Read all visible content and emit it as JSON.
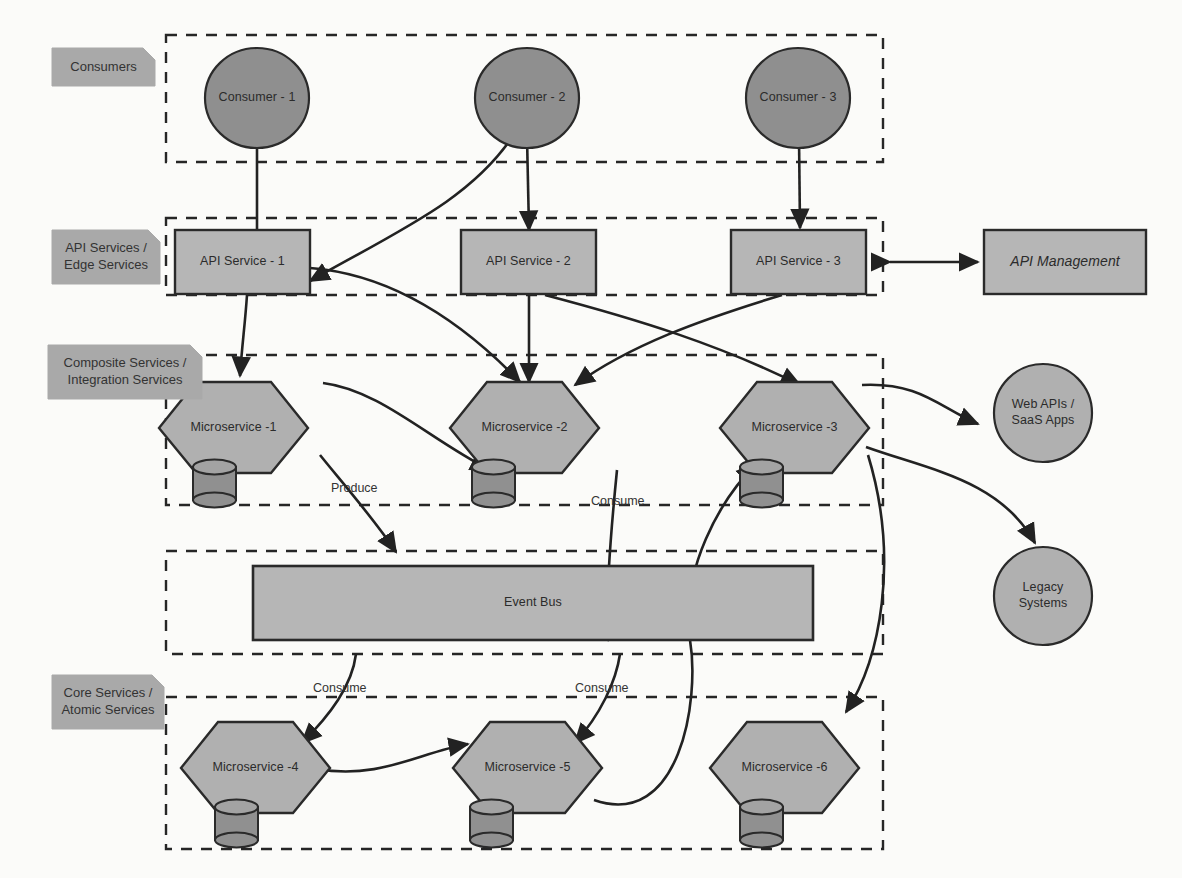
{
  "diagram": {
    "colors": {
      "consumer_fill": "#8f8f8f",
      "service_fill": "#b6b6b6",
      "hexagon_fill": "#b0b0b0",
      "db_fill": "#909090",
      "tag_fill": "#a9a9a9",
      "stroke": "#2a2a2a",
      "background": "#fbfbf9"
    }
  },
  "layers": [
    {
      "id": "consumers",
      "label": "Consumers"
    },
    {
      "id": "api",
      "label": "API Services /\nEdge Services"
    },
    {
      "id": "composite",
      "label": "Composite Services /\nIntegration Services"
    },
    {
      "id": "eventbus",
      "label": ""
    },
    {
      "id": "core",
      "label": "Core Services /\nAtomic Services"
    }
  ],
  "layer_tags": [
    {
      "name": "tag-consumers",
      "line1": "Consumers",
      "line2": ""
    },
    {
      "name": "tag-api-services",
      "line1": "API Services /",
      "line2": "Edge Services"
    },
    {
      "name": "tag-composite-services",
      "line1": "Composite Services /",
      "line2": "Integration Services"
    },
    {
      "name": "tag-core-services",
      "line1": "Core Services /",
      "line2": "Atomic Services"
    }
  ],
  "consumers": [
    {
      "name": "consumer-1",
      "label": "Consumer - 1"
    },
    {
      "name": "consumer-2",
      "label": "Consumer - 2"
    },
    {
      "name": "consumer-3",
      "label": "Consumer - 3"
    }
  ],
  "api_services": [
    {
      "name": "api-service-1",
      "label": "API Service - 1"
    },
    {
      "name": "api-service-2",
      "label": "API Service - 2"
    },
    {
      "name": "api-service-3",
      "label": "API Service - 3"
    }
  ],
  "api_management": {
    "name": "api-management",
    "label": "API Management"
  },
  "composite_microservices": [
    {
      "name": "microservice-1",
      "label": "Microservice -1"
    },
    {
      "name": "microservice-2",
      "label": "Microservice -2"
    },
    {
      "name": "microservice-3",
      "label": "Microservice -3"
    }
  ],
  "core_microservices": [
    {
      "name": "microservice-4",
      "label": "Microservice -4"
    },
    {
      "name": "microservice-5",
      "label": "Microservice -5"
    },
    {
      "name": "microservice-6",
      "label": "Microservice -6"
    }
  ],
  "event_bus": {
    "name": "event-bus",
    "label": "Event Bus"
  },
  "external_systems": [
    {
      "name": "web-apis-saas-apps",
      "line1": "Web APIs /",
      "line2": "SaaS Apps"
    },
    {
      "name": "legacy-systems",
      "line1": "Legacy",
      "line2": "Systems"
    }
  ],
  "edge_labels": [
    {
      "name": "edge-label-produce",
      "label": "Produce"
    },
    {
      "name": "edge-label-consume-ms2",
      "label": "Consume"
    },
    {
      "name": "edge-label-consume-ms4",
      "label": "Consume"
    },
    {
      "name": "edge-label-consume-ms5",
      "label": "Consume"
    }
  ]
}
